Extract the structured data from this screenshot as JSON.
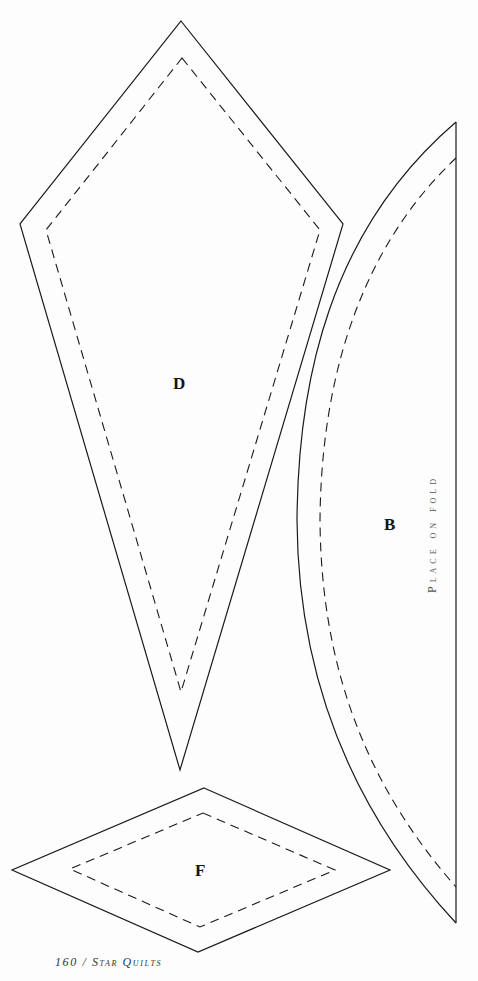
{
  "page": {
    "background": "#fdfdfd",
    "line_color": "#1a1a1a"
  },
  "pieces": [
    {
      "id": "D",
      "label": "D",
      "shape": "kite",
      "outline_points": [
        [
          181,
          21
        ],
        [
          343,
          224
        ],
        [
          180,
          770
        ],
        [
          20,
          224
        ]
      ],
      "seam_points": [
        [
          182,
          58
        ],
        [
          320,
          230
        ],
        [
          181,
          692
        ],
        [
          46,
          230
        ]
      ]
    },
    {
      "id": "B",
      "label": "B",
      "shape": "half-arc",
      "note": "Place on fold",
      "fold_line": {
        "x": 456,
        "y1": 122,
        "y2": 923
      },
      "outline_curve": "M456,122 C330,230 298,380 297,520 C298,690 360,820 456,923",
      "seam_curve": "M456,158 C352,256 321,395 320,520 C321,680 375,795 456,887"
    },
    {
      "id": "F",
      "label": "F",
      "shape": "diamond",
      "outline_points": [
        [
          204,
          788
        ],
        [
          390,
          870
        ],
        [
          198,
          952
        ],
        [
          12,
          870
        ]
      ],
      "seam_points": [
        [
          203,
          813
        ],
        [
          335,
          870
        ],
        [
          200,
          927
        ],
        [
          70,
          869
        ]
      ]
    }
  ],
  "footer": {
    "page_number": "160",
    "separator": "/",
    "book_title": "Star Quilts",
    "text": "160 / Star Quilts"
  }
}
